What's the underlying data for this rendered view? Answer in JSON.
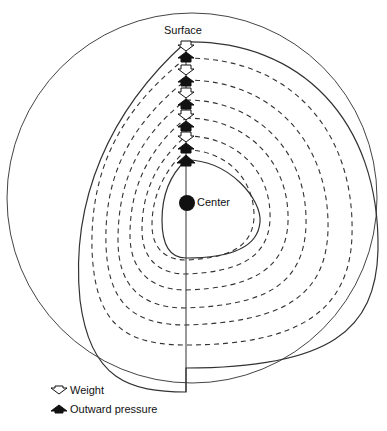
{
  "diagram": {
    "labels": {
      "surface": "Surface",
      "center": "Center"
    },
    "legend": [
      {
        "icon": "hollow-down-arrow-icon",
        "label": "Weight"
      },
      {
        "icon": "filled-up-arrow-icon",
        "label": "Outward pressure"
      }
    ],
    "caption": "",
    "colors": {
      "line": "#333333",
      "background": "#ffffff"
    }
  }
}
